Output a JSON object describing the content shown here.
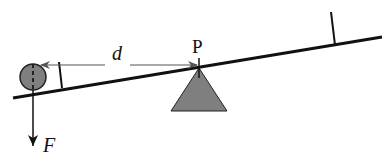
{
  "diagram": {
    "type": "lever",
    "colors": {
      "line": "#111111",
      "fill_gray": "#7f7f7f",
      "arrow_thin": "#555555",
      "background": "#ffffff"
    },
    "labels": {
      "distance": "d",
      "pivot": "P",
      "force": "F"
    },
    "elements": {
      "beam": "inclined lever beam",
      "pivot_triangle": "fulcrum",
      "mass": "circular weight at left end",
      "left_marker": "perpendicular tick at left",
      "right_marker": "perpendicular tick at right",
      "distance_arrow": "horizontal arrow from pivot to mass",
      "force_arrow": "downward force arrow"
    }
  }
}
